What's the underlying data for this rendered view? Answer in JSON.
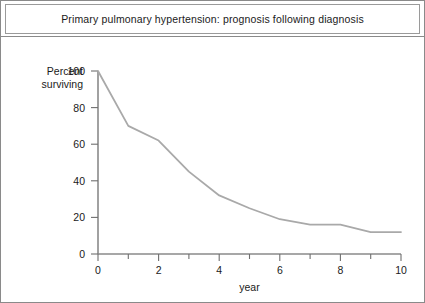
{
  "figure": {
    "title": "Primary pulmonary hypertension: prognosis following diagnosis"
  },
  "chart_data": {
    "type": "line",
    "title": "Primary pulmonary hypertension: prognosis following diagnosis",
    "xlabel": "year",
    "ylabel": "Percent surviving",
    "xlim": [
      0,
      10
    ],
    "ylim": [
      0,
      100
    ],
    "xticks": [
      0,
      2,
      4,
      6,
      8,
      10
    ],
    "xtick_labels": [
      "0",
      "2",
      "4",
      "6",
      "8",
      "10"
    ],
    "xminorticks": [
      1,
      3,
      5,
      7,
      9
    ],
    "yticks": [
      0,
      20,
      40,
      60,
      80,
      100
    ],
    "ytick_labels": [
      "0",
      "20",
      "40",
      "60",
      "80",
      "100"
    ],
    "grid": false,
    "legend": false,
    "line_color": "#a9a9a9",
    "x": [
      0,
      1,
      2,
      3,
      4,
      5,
      6,
      7,
      8,
      9,
      10
    ],
    "values": [
      100,
      70,
      62,
      45,
      32,
      25,
      19,
      16,
      16,
      12,
      12
    ],
    "series": [
      {
        "name": "Percent surviving",
        "values": [
          100,
          70,
          62,
          45,
          32,
          25,
          19,
          16,
          16,
          12,
          12
        ]
      }
    ]
  },
  "axes": {
    "ylabel_line1": "Percent",
    "ylabel_line2": "surviving",
    "xlabel": "year"
  }
}
